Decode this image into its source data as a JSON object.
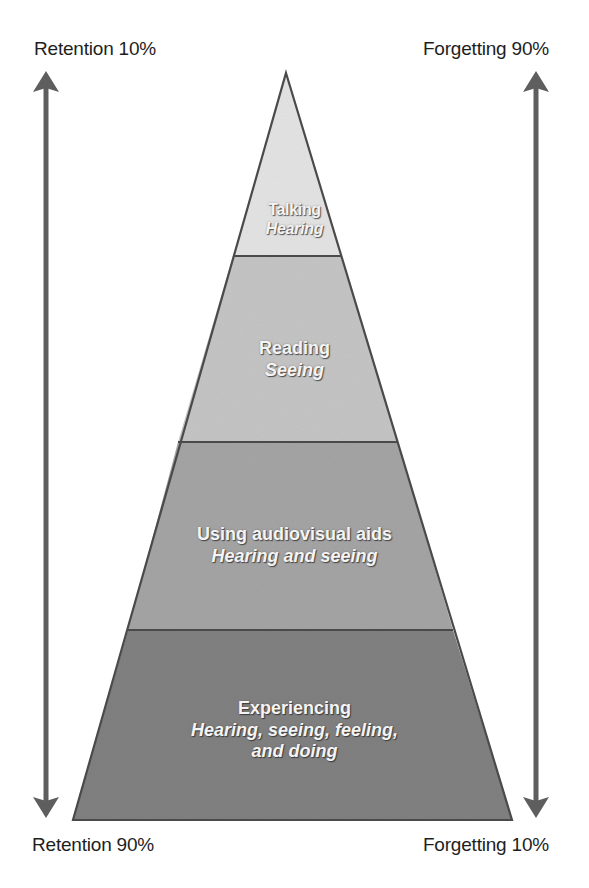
{
  "labels": {
    "top_left": "Retention 10%",
    "top_right": "Forgetting 90%",
    "bottom_left": "Retention 90%",
    "bottom_right": "Forgetting 10%"
  },
  "pyramid": {
    "tiers": [
      {
        "title": "Talking",
        "subtitle": "Hearing",
        "fill": "#e3e3e3"
      },
      {
        "title": "Reading",
        "subtitle": "Seeing",
        "fill": "#c4c4c4"
      },
      {
        "title": "Using audiovisual aids",
        "subtitle": "Hearing and seeing",
        "fill": "#a4a4a4"
      },
      {
        "title": "Experiencing",
        "subtitle_lines": [
          "Hearing, seeing, feeling,",
          "and doing"
        ],
        "fill": "#808080"
      }
    ],
    "outline_color": "#4a4a4a"
  },
  "arrows": {
    "left": {
      "meaning": "retention-scale",
      "color": "#5e5e5e"
    },
    "right": {
      "meaning": "forgetting-scale",
      "color": "#5e5e5e"
    }
  }
}
